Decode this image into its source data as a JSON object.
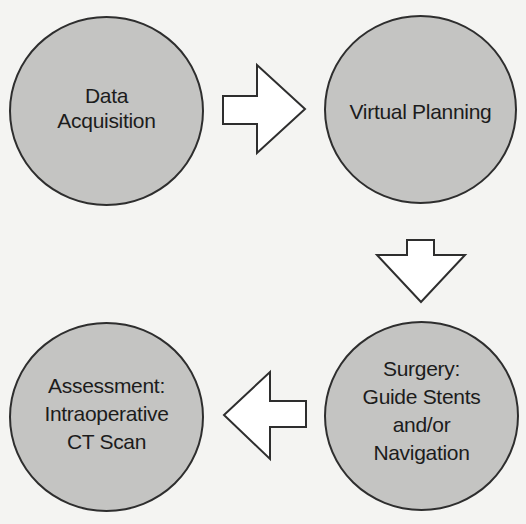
{
  "diagram": {
    "type": "cyclic-process-flow",
    "colors": {
      "background": "#f4f4f2",
      "node_fill": "#c4c4c2",
      "node_stroke": "#2e2e2e",
      "arrow_fill": "#ffffff",
      "arrow_stroke": "#2e2e2e",
      "text": "#1c1c1c"
    },
    "nodes": [
      {
        "id": "data-acquisition",
        "label": "Data\nAcquisition",
        "position": "top-left"
      },
      {
        "id": "virtual-planning",
        "label": "Virtual Planning",
        "position": "top-right"
      },
      {
        "id": "surgery",
        "label": "Surgery:\nGuide Stents\nand/or\nNavigation",
        "position": "bottom-right"
      },
      {
        "id": "assessment",
        "label": "Assessment:\nIntraoperative\nCT Scan",
        "position": "bottom-left"
      }
    ],
    "edges": [
      {
        "from": "data-acquisition",
        "to": "virtual-planning",
        "direction": "right"
      },
      {
        "from": "virtual-planning",
        "to": "surgery",
        "direction": "down"
      },
      {
        "from": "surgery",
        "to": "assessment",
        "direction": "left"
      }
    ]
  }
}
